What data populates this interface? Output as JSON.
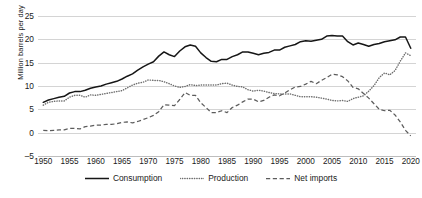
{
  "chart_data": {
    "type": "line",
    "title": "",
    "xlabel": "",
    "ylabel": "Million barrels per day",
    "ylim": [
      -5,
      25
    ],
    "yticks": [
      -5,
      0,
      5,
      10,
      15,
      20,
      25
    ],
    "xlim": [
      1949,
      2021
    ],
    "xticks": [
      1950,
      1955,
      1960,
      1965,
      1970,
      1975,
      1980,
      1985,
      1990,
      1995,
      2000,
      2005,
      2010,
      2015,
      2020
    ],
    "grid": true,
    "legend_position": "bottom",
    "x": [
      1950,
      1951,
      1952,
      1953,
      1954,
      1955,
      1956,
      1957,
      1958,
      1959,
      1960,
      1961,
      1962,
      1963,
      1964,
      1965,
      1966,
      1967,
      1968,
      1969,
      1970,
      1971,
      1972,
      1973,
      1974,
      1975,
      1976,
      1977,
      1978,
      1979,
      1980,
      1981,
      1982,
      1983,
      1984,
      1985,
      1986,
      1987,
      1988,
      1989,
      1990,
      1991,
      1992,
      1993,
      1994,
      1995,
      1996,
      1997,
      1998,
      1999,
      2000,
      2001,
      2002,
      2003,
      2004,
      2005,
      2006,
      2007,
      2008,
      2009,
      2010,
      2011,
      2012,
      2013,
      2014,
      2015,
      2016,
      2017,
      2018,
      2019,
      2020
    ],
    "series": [
      {
        "name": "Consumption",
        "style": "solid",
        "color": "#161616",
        "values": [
          6.5,
          7.0,
          7.3,
          7.6,
          7.8,
          8.5,
          8.8,
          8.8,
          9.1,
          9.5,
          9.8,
          10.0,
          10.4,
          10.7,
          11.0,
          11.5,
          12.1,
          12.6,
          13.4,
          14.1,
          14.7,
          15.2,
          16.4,
          17.3,
          16.7,
          16.3,
          17.5,
          18.4,
          18.8,
          18.5,
          17.1,
          16.1,
          15.3,
          15.2,
          15.7,
          15.7,
          16.3,
          16.7,
          17.3,
          17.3,
          17.0,
          16.7,
          17.0,
          17.2,
          17.7,
          17.7,
          18.3,
          18.6,
          18.9,
          19.5,
          19.7,
          19.6,
          19.8,
          20.0,
          20.7,
          20.8,
          20.7,
          20.7,
          19.5,
          18.8,
          19.2,
          18.9,
          18.5,
          18.9,
          19.1,
          19.5,
          19.7,
          19.9,
          20.5,
          20.5,
          18.1
        ]
      },
      {
        "name": "Production",
        "style": "dotted",
        "color": "#6e6e6e",
        "values": [
          5.9,
          6.5,
          6.7,
          6.8,
          6.8,
          7.6,
          8.0,
          8.0,
          7.6,
          8.1,
          8.0,
          8.2,
          8.4,
          8.6,
          8.8,
          9.0,
          9.6,
          10.2,
          10.6,
          10.8,
          11.3,
          11.2,
          11.2,
          10.9,
          10.5,
          10.0,
          9.7,
          9.9,
          10.3,
          10.1,
          10.2,
          10.2,
          10.2,
          10.2,
          10.5,
          10.6,
          10.2,
          9.9,
          9.8,
          9.2,
          8.9,
          9.1,
          8.9,
          8.6,
          8.4,
          8.3,
          8.3,
          8.3,
          8.0,
          7.7,
          7.7,
          7.7,
          7.6,
          7.4,
          7.2,
          6.9,
          6.8,
          6.9,
          6.7,
          7.3,
          7.6,
          7.9,
          8.9,
          10.1,
          11.8,
          12.8,
          12.4,
          13.3,
          15.3,
          17.1,
          16.5
        ]
      },
      {
        "name": "Net imports",
        "style": "dashed",
        "color": "#5c5c5c",
        "values": [
          0.5,
          0.4,
          0.5,
          0.6,
          0.6,
          0.9,
          0.9,
          0.8,
          1.3,
          1.4,
          1.6,
          1.6,
          1.8,
          1.8,
          1.9,
          2.2,
          2.3,
          2.1,
          2.4,
          2.8,
          3.2,
          3.7,
          4.5,
          6.0,
          5.9,
          5.8,
          7.1,
          8.6,
          8.0,
          8.0,
          6.4,
          5.4,
          4.3,
          4.3,
          4.7,
          4.3,
          5.4,
          5.9,
          6.6,
          7.2,
          7.2,
          6.6,
          6.9,
          7.6,
          8.1,
          7.9,
          8.5,
          9.2,
          9.8,
          9.9,
          10.4,
          11.0,
          10.5,
          11.2,
          11.8,
          12.5,
          12.4,
          12.0,
          11.1,
          9.7,
          9.4,
          8.4,
          7.4,
          6.2,
          5.0,
          4.7,
          4.8,
          3.8,
          2.3,
          0.5,
          -0.7
        ]
      }
    ]
  },
  "legend": {
    "items": [
      {
        "label": "Consumption",
        "style": "solid"
      },
      {
        "label": "Production",
        "style": "dotted"
      },
      {
        "label": "Net imports",
        "style": "dashed"
      }
    ]
  }
}
